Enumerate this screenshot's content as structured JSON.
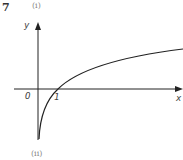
{
  "question": {
    "number": "7",
    "part_top": "(i)",
    "part_bottom": "(ii)"
  },
  "axes": {
    "x_label": "x",
    "y_label": "y",
    "origin_label": "O",
    "tick_label": "1"
  },
  "colors": {
    "axis": "#222222",
    "curve": "#222222",
    "text": "#444444"
  },
  "curve": {
    "description": "logarithmic curve y = log x, passing through (1, 0), asymptotic to the negative y-axis"
  }
}
